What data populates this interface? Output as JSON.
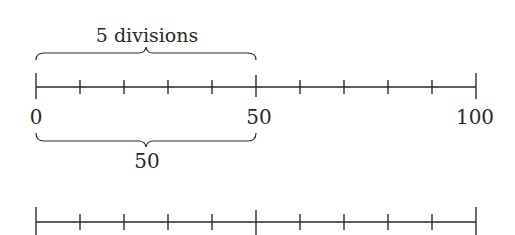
{
  "diagram": {
    "title_label": "5 divisions",
    "top_axis": {
      "min": 0,
      "max": 100,
      "divisions": 10,
      "major_ticks": [
        0,
        50,
        100
      ],
      "labels": [
        "0",
        "50",
        "100"
      ]
    },
    "brace_top": {
      "from": 0,
      "to": 50,
      "label": "5 divisions"
    },
    "brace_bottom": {
      "from": 0,
      "to": 50,
      "label": "50"
    },
    "bottom_axis": {
      "divisions": 10,
      "major_tick_positions": [
        0,
        5,
        10
      ],
      "labels": []
    },
    "colors": {
      "stroke": "#2a2a2a",
      "background": "#ffffff"
    }
  }
}
